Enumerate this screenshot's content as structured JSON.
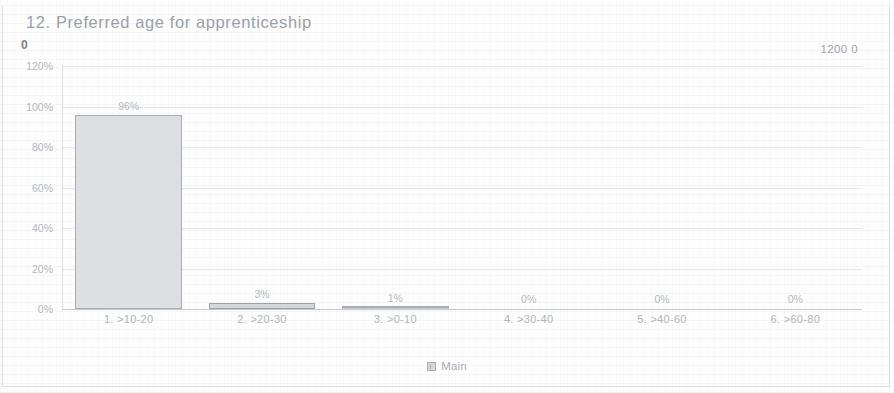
{
  "chart_title": "12. Preferred age for apprenticeship",
  "header": {
    "left_value": "0",
    "right_value": "1200 0"
  },
  "legend": {
    "swatch_name": "series-color-swatch",
    "label": "Main"
  },
  "colors": {
    "bar_fill": "#dcdee1",
    "bar_border": "#a9adb4",
    "text": "#b0b5bc",
    "title": "#9aa0a8",
    "gridline": "#c8cbd1"
  },
  "chart_data": {
    "type": "bar",
    "title": "12. Preferred age for apprenticeship",
    "xlabel": "",
    "ylabel": "",
    "categories": [
      "1. >10-20",
      "2. >20-30",
      "3. >0-10",
      "4. >30-40",
      "5. >40-60",
      "6. >60-80"
    ],
    "values": [
      96,
      3,
      1,
      0,
      0,
      0
    ],
    "data_labels": [
      "96%",
      "3%",
      "1%",
      "0%",
      "0%",
      "0%"
    ],
    "series": [
      {
        "name": "Main",
        "values": [
          96,
          3,
          1,
          0,
          0,
          0
        ]
      }
    ],
    "ylim": [
      0,
      120
    ],
    "ytick_labels": [
      "120%",
      "100%",
      "80%",
      "60%",
      "40%",
      "20%",
      "0%"
    ],
    "ytick_values": [
      120,
      100,
      80,
      60,
      40,
      20,
      0
    ],
    "grid": true,
    "legend_position": "bottom"
  }
}
